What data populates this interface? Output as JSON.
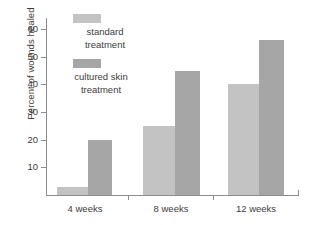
{
  "chart_data": {
    "type": "bar",
    "title": "",
    "xlabel": "",
    "ylabel": "Percent of wounds healed",
    "categories": [
      "4 weeks",
      "8 weeks",
      "12 weeks"
    ],
    "ylim": [
      0,
      60
    ],
    "yticks": [
      10,
      20,
      30,
      40,
      50,
      60
    ],
    "ytick_labels": [
      "10",
      "20",
      "30",
      "40",
      "50",
      "60"
    ],
    "grid": false,
    "legend_position": "upper-left-inside",
    "series": [
      {
        "name": "standard treatment",
        "name_lines": [
          "standard",
          "treatment"
        ],
        "color": "#c3c3c3",
        "values": [
          3,
          25,
          40
        ]
      },
      {
        "name": "cultured skin treatment",
        "name_lines": [
          "cultured skin",
          "treatment"
        ],
        "color": "#a6a6a6",
        "values": [
          20,
          45,
          56
        ]
      }
    ]
  },
  "axis": {
    "line_color": "#8d8d8d",
    "text_color": "#3d3d3d"
  },
  "legend": {
    "items": [
      {
        "label_line1": "standard",
        "label_line2": "treatment",
        "color": "#c3c3c3"
      },
      {
        "label_line1": "cultured skin",
        "label_line2": "treatment",
        "color": "#a6a6a6"
      }
    ]
  }
}
